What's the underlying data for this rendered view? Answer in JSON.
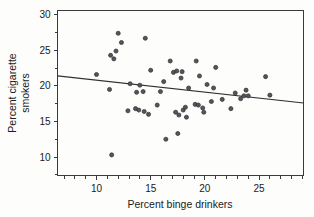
{
  "chart_data": {
    "type": "scatter",
    "title": "",
    "xlabel": "Percent binge drinkers",
    "ylabel": "Percent cigarette smokers",
    "xlim": [
      6.4,
      29.1
    ],
    "ylim": [
      7.4,
      30.6
    ],
    "xticks": [
      10,
      15,
      20,
      25
    ],
    "yticks": [
      10,
      15,
      20,
      25,
      30
    ],
    "xtick_labels": [
      "10",
      "15",
      "20",
      "25"
    ],
    "ytick_labels": [
      "10",
      "15",
      "20",
      "25",
      "30"
    ],
    "x_minor_tick_step": 1,
    "y_minor_tick_step": 2.5,
    "grid": false,
    "legend": null,
    "marker": {
      "shape": "circle",
      "fill": "#55555a",
      "edge": "#2e2e33",
      "size_px": 4.1
    },
    "points": [
      {
        "x": 10.0,
        "y": 21.6
      },
      {
        "x": 11.2,
        "y": 19.5
      },
      {
        "x": 11.3,
        "y": 24.3
      },
      {
        "x": 11.4,
        "y": 10.3
      },
      {
        "x": 11.6,
        "y": 23.8
      },
      {
        "x": 11.8,
        "y": 24.9
      },
      {
        "x": 12.0,
        "y": 27.4
      },
      {
        "x": 12.3,
        "y": 26.1
      },
      {
        "x": 12.9,
        "y": 16.5
      },
      {
        "x": 13.1,
        "y": 20.3
      },
      {
        "x": 13.6,
        "y": 16.8
      },
      {
        "x": 13.7,
        "y": 19.1
      },
      {
        "x": 13.9,
        "y": 16.6
      },
      {
        "x": 14.0,
        "y": 20.1
      },
      {
        "x": 14.3,
        "y": 19.2
      },
      {
        "x": 14.4,
        "y": 16.4
      },
      {
        "x": 14.5,
        "y": 26.7
      },
      {
        "x": 14.8,
        "y": 16.0
      },
      {
        "x": 15.0,
        "y": 22.2
      },
      {
        "x": 15.6,
        "y": 17.3
      },
      {
        "x": 15.9,
        "y": 19.2
      },
      {
        "x": 16.2,
        "y": 20.6
      },
      {
        "x": 16.4,
        "y": 12.5
      },
      {
        "x": 16.8,
        "y": 23.5
      },
      {
        "x": 17.1,
        "y": 21.9
      },
      {
        "x": 17.3,
        "y": 16.3
      },
      {
        "x": 17.4,
        "y": 22.1
      },
      {
        "x": 17.5,
        "y": 13.3
      },
      {
        "x": 17.6,
        "y": 15.9
      },
      {
        "x": 17.8,
        "y": 21.1
      },
      {
        "x": 17.9,
        "y": 22.0
      },
      {
        "x": 18.0,
        "y": 16.6
      },
      {
        "x": 18.2,
        "y": 17.0
      },
      {
        "x": 18.3,
        "y": 15.6
      },
      {
        "x": 18.5,
        "y": 19.7
      },
      {
        "x": 19.1,
        "y": 17.4
      },
      {
        "x": 19.2,
        "y": 23.5
      },
      {
        "x": 19.4,
        "y": 17.3
      },
      {
        "x": 19.5,
        "y": 21.4
      },
      {
        "x": 19.8,
        "y": 16.9
      },
      {
        "x": 19.9,
        "y": 16.3
      },
      {
        "x": 20.2,
        "y": 20.2
      },
      {
        "x": 20.6,
        "y": 17.8
      },
      {
        "x": 20.8,
        "y": 19.7
      },
      {
        "x": 21.0,
        "y": 22.6
      },
      {
        "x": 21.6,
        "y": 18.1
      },
      {
        "x": 22.4,
        "y": 16.8
      },
      {
        "x": 22.8,
        "y": 19.0
      },
      {
        "x": 23.3,
        "y": 18.2
      },
      {
        "x": 23.6,
        "y": 18.6
      },
      {
        "x": 23.8,
        "y": 19.4
      },
      {
        "x": 24.0,
        "y": 18.6
      },
      {
        "x": 25.6,
        "y": 21.3
      },
      {
        "x": 26.0,
        "y": 18.7
      }
    ],
    "fit_line": {
      "x_start": 6.4,
      "y_start": 21.4,
      "x_end": 29.1,
      "y_end": 17.6,
      "color": "#303030"
    }
  }
}
